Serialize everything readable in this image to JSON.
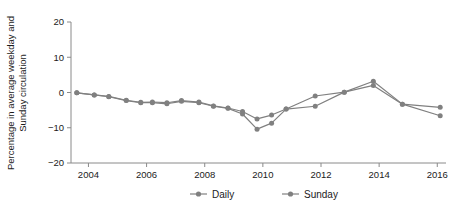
{
  "chart_data": {
    "type": "line",
    "title": "",
    "subtitle": "",
    "xlabel": "",
    "ylabel": "Percentage in average weekday and Sunday circulation",
    "ylabel_line1": "Percentage in average weekday and",
    "ylabel_line2": "Sunday circulation",
    "xlim": [
      2003.4,
      2016.3
    ],
    "ylim": [
      -20,
      20
    ],
    "yticks": [
      20,
      10,
      0,
      -10,
      -20
    ],
    "ytick_labels": [
      "20",
      "10",
      "0",
      "−10",
      "−20"
    ],
    "xticks": [
      2004,
      2006,
      2008,
      2010,
      2012,
      2014,
      2016
    ],
    "xtick_labels": [
      "2004",
      "2006",
      "2008",
      "2010",
      "2012",
      "2014",
      "2016"
    ],
    "grid": false,
    "legend_position": "bottom",
    "x": [
      2003.6,
      2004.2,
      2004.7,
      2005.3,
      2005.8,
      2006.2,
      2006.7,
      2007.2,
      2007.8,
      2008.3,
      2008.8,
      2009.3,
      2009.8,
      2010.3,
      2010.8,
      2011.8,
      2012.8,
      2013.8,
      2014.8,
      2016.1
    ],
    "series": [
      {
        "name": "Daily",
        "color": "#808080",
        "values": [
          -0.1,
          -0.7,
          -1.1,
          -2.2,
          -2.8,
          -2.7,
          -2.9,
          -2.3,
          -2.7,
          -3.8,
          -4.4,
          -5.4,
          -7.5,
          -6.4,
          -4.7,
          -1.0,
          0.1,
          3.2,
          -3.3,
          -4.2
        ]
      },
      {
        "name": "Sunday",
        "color": "#808080",
        "values": [
          -0.1,
          -0.7,
          -1.2,
          -2.3,
          -2.9,
          -2.9,
          -3.2,
          -2.5,
          -2.9,
          -3.9,
          -4.5,
          -6.1,
          -10.4,
          -8.7,
          -4.7,
          -3.9,
          0.1,
          2.0,
          -3.3,
          -6.6
        ]
      }
    ]
  },
  "legend": {
    "items": [
      {
        "label": "Daily",
        "color": "#808080"
      },
      {
        "label": "Sunday",
        "color": "#808080"
      }
    ]
  },
  "colors": {
    "series": "#808080",
    "axis": "#8a8a8a",
    "text": "#1b1b1b",
    "background": "#ffffff"
  }
}
